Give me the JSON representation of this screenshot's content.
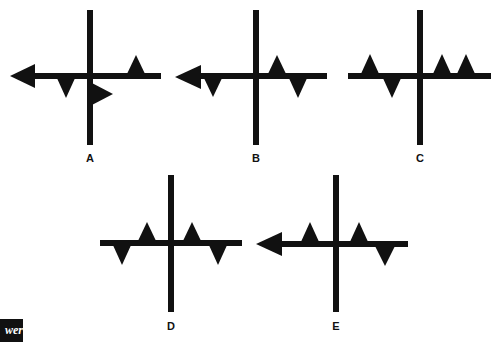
{
  "figure": {
    "ink_color": "#111111",
    "background": "#ffffff",
    "options": [
      {
        "label": "A",
        "label_pos": [
          90,
          152
        ],
        "vertical": {
          "x": 90,
          "y1": 10,
          "y2": 145
        },
        "horizontal": {
          "y": 76,
          "x1": 28,
          "x2": 161
        },
        "arrow_left": {
          "tip": [
            10,
            76
          ],
          "base_x": 35,
          "half": 12
        },
        "triangles": [
          {
            "dir": "down",
            "cx": 66,
            "base_y": 76,
            "half": 10,
            "h": 22
          },
          {
            "dir": "right",
            "cx": 90,
            "cy": 94,
            "half": 12,
            "h": 23
          },
          {
            "dir": "up",
            "cx": 136,
            "base_y": 76,
            "half": 10,
            "h": 21
          }
        ]
      },
      {
        "label": "B",
        "label_pos": [
          256,
          152
        ],
        "vertical": {
          "x": 256,
          "y1": 10,
          "y2": 145
        },
        "horizontal": {
          "y": 76,
          "x1": 195,
          "x2": 327
        },
        "arrow_left": {
          "tip": [
            175,
            77
          ],
          "base_x": 201,
          "half": 12
        },
        "triangles": [
          {
            "dir": "down",
            "cx": 213,
            "base_y": 76,
            "half": 10,
            "h": 21
          },
          {
            "dir": "up",
            "cx": 277,
            "base_y": 76,
            "half": 10,
            "h": 21
          },
          {
            "dir": "down",
            "cx": 298,
            "base_y": 76,
            "half": 10,
            "h": 22
          }
        ]
      },
      {
        "label": "C",
        "label_pos": [
          420,
          152
        ],
        "vertical": {
          "x": 420,
          "y1": 10,
          "y2": 145
        },
        "horizontal": {
          "y": 76,
          "x1": 348,
          "x2": 491
        },
        "arrow_left": null,
        "triangles": [
          {
            "dir": "up",
            "cx": 370,
            "base_y": 76,
            "half": 10,
            "h": 22
          },
          {
            "dir": "down",
            "cx": 392,
            "base_y": 76,
            "half": 10,
            "h": 22
          },
          {
            "dir": "up",
            "cx": 442,
            "base_y": 76,
            "half": 10,
            "h": 22
          },
          {
            "dir": "up",
            "cx": 466,
            "base_y": 76,
            "half": 10,
            "h": 22
          }
        ]
      },
      {
        "label": "D",
        "label_pos": [
          171,
          320
        ],
        "vertical": {
          "x": 171,
          "y1": 175,
          "y2": 312
        },
        "horizontal": {
          "y": 243,
          "x1": 100,
          "x2": 242
        },
        "arrow_left": null,
        "triangles": [
          {
            "dir": "down",
            "cx": 122,
            "base_y": 243,
            "half": 10,
            "h": 22
          },
          {
            "dir": "up",
            "cx": 147,
            "base_y": 243,
            "half": 10,
            "h": 21
          },
          {
            "dir": "up",
            "cx": 192,
            "base_y": 243,
            "half": 10,
            "h": 21
          },
          {
            "dir": "down",
            "cx": 218,
            "base_y": 243,
            "half": 10,
            "h": 22
          }
        ]
      },
      {
        "label": "E",
        "label_pos": [
          336,
          320
        ],
        "vertical": {
          "x": 336,
          "y1": 175,
          "y2": 312
        },
        "horizontal": {
          "y": 244,
          "x1": 276,
          "x2": 408
        },
        "arrow_left": {
          "tip": [
            256,
            244
          ],
          "base_x": 282,
          "half": 12
        },
        "triangles": [
          {
            "dir": "up",
            "cx": 310,
            "base_y": 244,
            "half": 10,
            "h": 22
          },
          {
            "dir": "up",
            "cx": 359,
            "base_y": 244,
            "half": 10,
            "h": 22
          },
          {
            "dir": "down",
            "cx": 385,
            "base_y": 244,
            "half": 11,
            "h": 22
          }
        ]
      }
    ]
  },
  "answer_tab": {
    "text": "wer"
  }
}
